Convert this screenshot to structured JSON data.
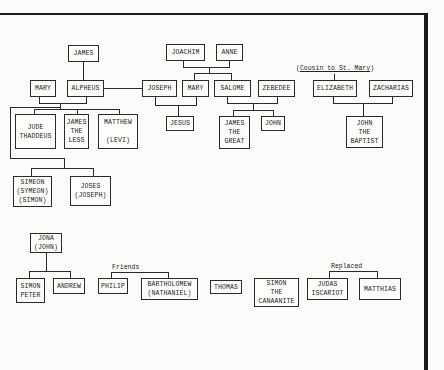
{
  "diagram": {
    "type": "family-tree",
    "nodes": {
      "james": "JAMES",
      "joachim": "JOACHIM",
      "anne": "ANNE",
      "mary_alpheus": "MARY",
      "alpheus": "ALPHEUS",
      "joseph": "JOSEPH",
      "mary_mother": "MARY",
      "salome": "SALOME",
      "zebedee": "ZEBEDEE",
      "elizabeth": "ELIZABETH",
      "zacharias": "ZACHARIAS",
      "jude_thaddeus": "JUDE\nTHADDEUS",
      "james_the_less": "JAMES\nTHE\nLESS",
      "matthew_levi": "MATTHEW\n\n(LEVI)",
      "jesus": "JESUS",
      "james_the_great": "JAMES\nTHE\nGREAT",
      "john": "JOHN",
      "john_the_baptist": "JOHN\nTHE\nBAPTIST",
      "simeon": "SIMEON\n(SYMEON)\n(SIMON)",
      "joses": "JOSES\n(JOSEPH)",
      "jona": "JONA\n(JOHN)",
      "simon_peter": "SIMON\nPETER",
      "andrew": "ANDREW",
      "philip": "PHILIP",
      "bartholomew": "BARTHOLOMEW\n(NATHANIEL)",
      "thomas": "THOMAS",
      "simon_canaanite": "SIMON\nTHE\nCANAANITE",
      "judas_iscariot": "JUDAS\nISCARIOT",
      "matthias": "MATTHIAS"
    },
    "annotations": {
      "cousin_prefix": "(",
      "cousin_text": "Cousin to St. Mary",
      "cousin_suffix": ")",
      "friends": "Friends",
      "replaced": "Replaced"
    },
    "relations": [
      {
        "parent": "JAMES",
        "child": "ALPHEUS"
      },
      {
        "parents": [
          "JOACHIM",
          "ANNE"
        ],
        "children": [
          "MARY",
          "SALOME"
        ]
      },
      {
        "marriage": [
          "MARY",
          "ALPHEUS"
        ],
        "children": [
          "JUDE THADDEUS",
          "JAMES THE LESS",
          "MATTHEW (LEVI)",
          "SIMEON",
          "JOSES"
        ]
      },
      {
        "link": [
          "ALPHEUS",
          "JOSEPH"
        ]
      },
      {
        "marriage": [
          "JOSEPH",
          "MARY"
        ],
        "children": [
          "JESUS"
        ]
      },
      {
        "marriage": [
          "SALOME",
          "ZEBEDEE"
        ],
        "children": [
          "JAMES THE GREAT",
          "JOHN"
        ]
      },
      {
        "marriage": [
          "ELIZABETH",
          "ZACHARIAS"
        ],
        "children": [
          "JOHN THE BAPTIST"
        ]
      },
      {
        "parent": "JONA (JOHN)",
        "children": [
          "SIMON PETER",
          "ANDREW"
        ]
      },
      {
        "label": "Friends",
        "between": [
          "PHILIP",
          "BARTHOLOMEW"
        ]
      },
      {
        "label": "Replaced",
        "between": [
          "JUDAS ISCARIOT",
          "MATTHIAS"
        ]
      }
    ]
  }
}
